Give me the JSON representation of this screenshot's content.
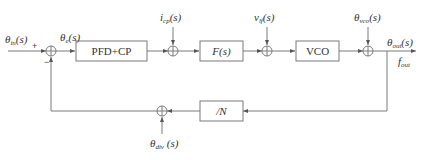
{
  "diagram": {
    "type": "block-diagram",
    "colors": {
      "line": "#7a7a7a",
      "text": "#333333",
      "background": "#ffffff"
    },
    "inputs": {
      "theta_in": {
        "sym": "θ",
        "sub": "in",
        "arg": "(s)"
      },
      "theta_e": {
        "sym": "θ",
        "sub": "e",
        "arg": "(s)"
      },
      "i_cp": {
        "sym": "i",
        "sub": "cp",
        "arg": "(s)"
      },
      "v_lf": {
        "sym": "v",
        "sub": "lf",
        "arg": "(s)"
      },
      "theta_vco": {
        "sym": "θ",
        "sub": "vco",
        "arg": "(s)"
      },
      "theta_out": {
        "sym": "θ",
        "sub": "out",
        "arg": "(s)"
      },
      "f_out": {
        "sym": "f",
        "sub": "out"
      },
      "theta_div": {
        "sym": "θ",
        "sub": "div",
        "arg": "(s)"
      }
    },
    "blocks": {
      "pfd_cp": "PFD+CP",
      "filter": "F(s)",
      "vco": "VCO",
      "divider": "/N"
    },
    "signs": {
      "plus": "+",
      "minus": "−"
    },
    "nodes": [
      "sum-input",
      "block-pfd-cp",
      "sum-icp",
      "block-filter",
      "sum-vlf",
      "block-vco",
      "sum-vco",
      "block-divider",
      "sum-div"
    ]
  }
}
